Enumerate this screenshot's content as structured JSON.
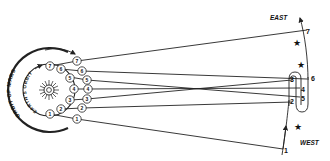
{
  "diagram": {
    "labels": {
      "east": "EAST",
      "west": "WEST",
      "earth_orbit": "EARTH'S ORBIT",
      "mars_orbit": "ORBIT OF MARS"
    },
    "earth_positions": [
      "1",
      "2",
      "3",
      "4",
      "5",
      "6",
      "7"
    ],
    "mars_positions": [
      "1",
      "2",
      "3",
      "4",
      "5",
      "6",
      "7"
    ],
    "apparent_path_positions": [
      "1",
      "2",
      "3",
      "4",
      "5",
      "6",
      "7"
    ],
    "icons": {
      "sun": "sun-icon",
      "star": "star-icon",
      "arrow": "arrow-icon"
    },
    "colors": {
      "ink": "#222222",
      "background": "#ffffff"
    }
  }
}
